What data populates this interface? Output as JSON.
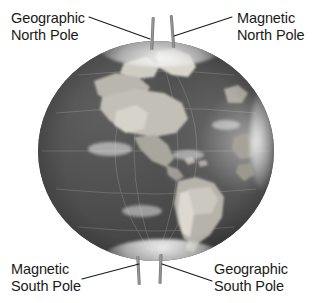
{
  "figure": {
    "background_color": "#ffffff",
    "text_color": "#1a1a1a",
    "leader_line_color": "#1a1a1a",
    "rod_color": "#8a8a8a"
  },
  "labels": {
    "geographic_north": {
      "line1": "Geographic",
      "line2": "North Pole"
    },
    "magnetic_north": {
      "line1": "Magnetic",
      "line2": "North Pole"
    },
    "magnetic_south": {
      "line1": "Magnetic",
      "line2": "South Pole"
    },
    "geographic_south": {
      "line1": "Geographic",
      "line2": "South Pole"
    }
  },
  "globe": {
    "name": "earth-globe",
    "view": "Americas",
    "rendering": "grayscale satellite photograph",
    "ocean_color": "#4a4a4a",
    "land_color": "#b9b6ae",
    "ice_cap_color": "#f2f2f2"
  },
  "axes": {
    "geographic_axis": {
      "name": "geographic-axis-rod",
      "poles": [
        "Geographic North Pole",
        "Geographic South Pole"
      ]
    },
    "magnetic_axis": {
      "name": "magnetic-axis-rod",
      "poles": [
        "Magnetic North Pole",
        "Magnetic South Pole"
      ]
    }
  }
}
